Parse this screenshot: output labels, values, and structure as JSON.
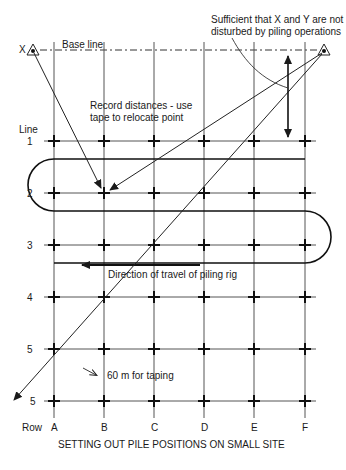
{
  "diagram": {
    "title": "SETTING OUT PILE POSITIONS ON SMALL SITE",
    "reference_points": [
      {
        "id": "X",
        "label": "X",
        "x": 33,
        "y": 50
      },
      {
        "id": "Y",
        "label": "",
        "x": 324,
        "y": 50
      }
    ],
    "base_line_label": "Base line",
    "line_axis_label": "Line",
    "row_axis_label": "Row",
    "lines": [
      "1",
      "2",
      "3",
      "4",
      "5",
      "5"
    ],
    "rows": [
      "A",
      "B",
      "C",
      "D",
      "E",
      "F"
    ],
    "annotations": {
      "undisturbed_note_line1": "Sufficient that X and Y are not",
      "undisturbed_note_line2": "disturbed by piling operations",
      "record_note_line1": "Record distances - use",
      "record_note_line2": "tape to relocate point",
      "travel_direction": "Direction of travel of piling rig",
      "taping_note": "60 m for taping"
    },
    "colors": {
      "line": "#1a1a1a",
      "grid": "#444444",
      "background": "#ffffff"
    }
  }
}
